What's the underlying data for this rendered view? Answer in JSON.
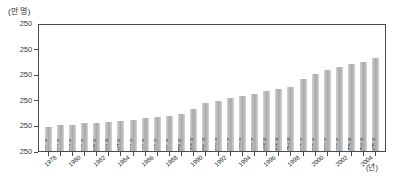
{
  "chart_data": {
    "type": "bar",
    "title": "",
    "subtitle": "",
    "xlabel": "(년)",
    "ylabel": "(만 명)",
    "grid": false,
    "legend": "none",
    "ylim": [
      250,
      250
    ],
    "y_tick_labels": [
      "250",
      "250",
      "250",
      "250",
      "250",
      "250"
    ],
    "categories": [
      "1978",
      "1979",
      "1980",
      "1981",
      "1982",
      "1983",
      "1984",
      "1985",
      "1986",
      "1987",
      "1988",
      "1989",
      "1990",
      "1991",
      "1992",
      "1993",
      "1994",
      "1995",
      "1996",
      "1997",
      "1998",
      "1999",
      "2000",
      "2001",
      "2002",
      "2003",
      "2004",
      "2005"
    ],
    "x_tick_labels": [
      "1978",
      "",
      "1980",
      "",
      "1982",
      "",
      "1984",
      "",
      "1986",
      "",
      "1988",
      "",
      "1990",
      "",
      "1992",
      "",
      "1994",
      "",
      "1996",
      "",
      "1998",
      "",
      "2000",
      "",
      "2002",
      "",
      "2004",
      ""
    ],
    "values": [
      70737,
      77528,
      78331,
      79386,
      80836,
      81751,
      84114,
      86958,
      88738,
      90402,
      94111,
      96442,
      107456,
      121667,
      126201,
      132181,
      136491,
      139591,
      148589,
      151212,
      155411,
      168682,
      177892,
      185201,
      191489,
      194440,
      197415,
      201248
    ],
    "bar_labels": [
      "70,737 명",
      "77,528 명",
      "78,331 명",
      "79,386 명",
      "80,836 명",
      "81,751 명",
      "84,114 명",
      "86,958 명",
      "88,738 명",
      "90,402 명",
      "94,111 명",
      "96,442 명",
      "107,456 명",
      "121,667 명",
      "126,201 명",
      "132,181 명",
      "136,491 명",
      "139,591 명",
      "148,589 명",
      "151,212 명",
      "155,411 명",
      "168,682 명",
      "177,892 명",
      "185,201 명",
      "191,489 명",
      "194,440 명",
      "197,415 명",
      "201,248 명"
    ],
    "bar_heights_pct": [
      19,
      21,
      21,
      22,
      22,
      23,
      24,
      25,
      26,
      27,
      28,
      29,
      33,
      38,
      40,
      42,
      44,
      45,
      48,
      49,
      51,
      57,
      61,
      64,
      67,
      69,
      71,
      74
    ],
    "colors": {
      "bar": "#b0b0b0",
      "axis": "#4a4a4a",
      "text": "#2b2b2b",
      "background": "#ffffff"
    }
  }
}
